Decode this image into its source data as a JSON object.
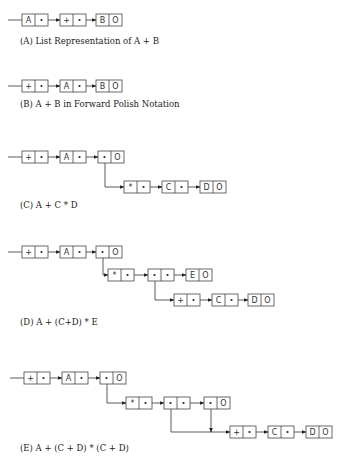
{
  "figures": [
    {
      "id": "A",
      "caption": "(A) List Representation of  A + B",
      "caption_y": 44,
      "nodes": [
        {
          "x": 22,
          "y": 14,
          "left": "A",
          "right": "•"
        },
        {
          "x": 60,
          "y": 14,
          "left": "+",
          "right": "•"
        },
        {
          "x": 96,
          "y": 14,
          "left": "B",
          "right": "O"
        }
      ],
      "links": [
        {
          "type": "h",
          "from": [
            8,
            20
          ],
          "to": [
            22,
            20
          ],
          "arrow": false
        },
        {
          "type": "h",
          "from": [
            45,
            20
          ],
          "to": [
            60,
            20
          ],
          "arrow": true
        },
        {
          "type": "h",
          "from": [
            81,
            20
          ],
          "to": [
            96,
            20
          ],
          "arrow": true
        }
      ]
    },
    {
      "id": "B",
      "caption": "(B)  A + B in Forward Polish Notation",
      "caption_y": 107,
      "nodes": [
        {
          "x": 22,
          "y": 80,
          "left": "+",
          "right": "•"
        },
        {
          "x": 60,
          "y": 80,
          "left": "A",
          "right": "•"
        },
        {
          "x": 96,
          "y": 80,
          "left": "B",
          "right": "O"
        }
      ],
      "links": [
        {
          "type": "h",
          "from": [
            8,
            86
          ],
          "to": [
            22,
            86
          ],
          "arrow": false
        },
        {
          "type": "h",
          "from": [
            45,
            86
          ],
          "to": [
            60,
            86
          ],
          "arrow": true
        },
        {
          "type": "h",
          "from": [
            81,
            86
          ],
          "to": [
            96,
            86
          ],
          "arrow": true
        }
      ]
    },
    {
      "id": "C",
      "caption": "(C)  A + C * D",
      "caption_y": 208,
      "nodes": [
        {
          "x": 22,
          "y": 151,
          "left": "+",
          "right": "•"
        },
        {
          "x": 60,
          "y": 151,
          "left": "A",
          "right": "•"
        },
        {
          "x": 98,
          "y": 151,
          "left": "•",
          "right": "O"
        },
        {
          "x": 124,
          "y": 181,
          "left": "*",
          "right": "•"
        },
        {
          "x": 162,
          "y": 181,
          "left": "C",
          "right": "•"
        },
        {
          "x": 200,
          "y": 181,
          "left": "D",
          "right": "O"
        }
      ],
      "links": [
        {
          "type": "h",
          "from": [
            8,
            157
          ],
          "to": [
            22,
            157
          ],
          "arrow": false
        },
        {
          "type": "h",
          "from": [
            43,
            157
          ],
          "to": [
            60,
            157
          ],
          "arrow": true
        },
        {
          "type": "h",
          "from": [
            81,
            157
          ],
          "to": [
            98,
            157
          ],
          "arrow": true
        },
        {
          "type": "elbow",
          "points": [
            [
              105,
              157
            ],
            [
              105,
              187
            ],
            [
              124,
              187
            ]
          ],
          "arrow": true
        },
        {
          "type": "h",
          "from": [
            145,
            187
          ],
          "to": [
            162,
            187
          ],
          "arrow": true
        },
        {
          "type": "h",
          "from": [
            183,
            187
          ],
          "to": [
            200,
            187
          ],
          "arrow": true
        }
      ]
    },
    {
      "id": "D",
      "caption": "(D)  A + (C+D) * E",
      "caption_y": 325,
      "nodes": [
        {
          "x": 22,
          "y": 246,
          "left": "+",
          "right": "•"
        },
        {
          "x": 60,
          "y": 246,
          "left": "A",
          "right": "•"
        },
        {
          "x": 96,
          "y": 246,
          "left": "•",
          "right": "O"
        },
        {
          "x": 108,
          "y": 269,
          "left": "*",
          "right": "•"
        },
        {
          "x": 148,
          "y": 269,
          "left": "•",
          "right": "•"
        },
        {
          "x": 186,
          "y": 269,
          "left": "E",
          "right": "O"
        },
        {
          "x": 174,
          "y": 294,
          "left": "+",
          "right": "•"
        },
        {
          "x": 212,
          "y": 294,
          "left": "C",
          "right": "•"
        },
        {
          "x": 248,
          "y": 294,
          "left": "D",
          "right": "O"
        }
      ],
      "links": [
        {
          "type": "h",
          "from": [
            8,
            252
          ],
          "to": [
            22,
            252
          ],
          "arrow": false
        },
        {
          "type": "h",
          "from": [
            43,
            252
          ],
          "to": [
            60,
            252
          ],
          "arrow": true
        },
        {
          "type": "h",
          "from": [
            81,
            252
          ],
          "to": [
            96,
            252
          ],
          "arrow": true
        },
        {
          "type": "elbow",
          "points": [
            [
              103,
              252
            ],
            [
              103,
              275
            ],
            [
              108,
              275
            ]
          ],
          "arrow": true
        },
        {
          "type": "h",
          "from": [
            129,
            275
          ],
          "to": [
            148,
            275
          ],
          "arrow": true
        },
        {
          "type": "h",
          "from": [
            169,
            275
          ],
          "to": [
            186,
            275
          ],
          "arrow": true
        },
        {
          "type": "elbow",
          "points": [
            [
              155,
              275
            ],
            [
              155,
              300
            ],
            [
              174,
              300
            ]
          ],
          "arrow": true
        },
        {
          "type": "h",
          "from": [
            195,
            300
          ],
          "to": [
            212,
            300
          ],
          "arrow": true
        },
        {
          "type": "h",
          "from": [
            233,
            300
          ],
          "to": [
            248,
            300
          ],
          "arrow": true
        }
      ]
    },
    {
      "id": "E",
      "caption": "(E)  A + (C + D) * (C + D)",
      "caption_y": 451,
      "nodes": [
        {
          "x": 24,
          "y": 372,
          "left": "+",
          "right": "•"
        },
        {
          "x": 62,
          "y": 372,
          "left": "A",
          "right": "•"
        },
        {
          "x": 100,
          "y": 372,
          "left": "•",
          "right": "O"
        },
        {
          "x": 126,
          "y": 397,
          "left": "*",
          "right": "•"
        },
        {
          "x": 164,
          "y": 397,
          "left": "•",
          "right": "•"
        },
        {
          "x": 204,
          "y": 397,
          "left": "•",
          "right": "O"
        },
        {
          "x": 230,
          "y": 426,
          "left": "+",
          "right": "•"
        },
        {
          "x": 268,
          "y": 426,
          "left": "C",
          "right": "•"
        },
        {
          "x": 306,
          "y": 426,
          "left": "D",
          "right": "O"
        }
      ],
      "links": [
        {
          "type": "h",
          "from": [
            10,
            378
          ],
          "to": [
            24,
            378
          ],
          "arrow": false
        },
        {
          "type": "h",
          "from": [
            45,
            378
          ],
          "to": [
            62,
            378
          ],
          "arrow": true
        },
        {
          "type": "h",
          "from": [
            83,
            378
          ],
          "to": [
            100,
            378
          ],
          "arrow": true
        },
        {
          "type": "elbow",
          "points": [
            [
              107,
              378
            ],
            [
              107,
              403
            ],
            [
              126,
              403
            ]
          ],
          "arrow": true
        },
        {
          "type": "h",
          "from": [
            147,
            403
          ],
          "to": [
            164,
            403
          ],
          "arrow": true
        },
        {
          "type": "h",
          "from": [
            185,
            403
          ],
          "to": [
            204,
            403
          ],
          "arrow": true
        },
        {
          "type": "elbow",
          "points": [
            [
              171,
              403
            ],
            [
              171,
              432
            ],
            [
              230,
              432
            ]
          ],
          "arrow": true
        },
        {
          "type": "v",
          "from": [
            211,
            403
          ],
          "to": [
            211,
            432
          ],
          "arrow": true
        },
        {
          "type": "h",
          "from": [
            251,
            432
          ],
          "to": [
            268,
            432
          ],
          "arrow": true
        },
        {
          "type": "h",
          "from": [
            289,
            432
          ],
          "to": [
            306,
            432
          ],
          "arrow": true
        }
      ]
    }
  ],
  "node_size": {
    "cell_w": 13,
    "h": 12
  }
}
